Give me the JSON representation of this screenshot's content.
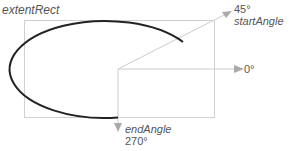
{
  "labels": {
    "extent_rect": "extentRect",
    "start_angle_value": "45°",
    "start_angle_name": "startAngle",
    "zero_angle": "0°",
    "end_angle_name": "endAngle",
    "end_angle_value": "270°"
  },
  "colors": {
    "rect": "#cccccc",
    "arc": "#222222",
    "arrow": "#aaaaaa",
    "text": "#555555"
  }
}
